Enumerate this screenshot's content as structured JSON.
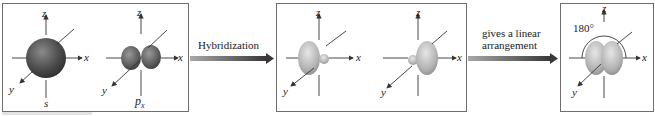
{
  "figure": {
    "panels": [
      {
        "id": "atomic-orbitals",
        "orbitals": [
          {
            "name": "s",
            "label": "s",
            "shape": "sphere"
          },
          {
            "name": "px",
            "label_main": "p",
            "label_sub": "x",
            "shape": "dumbbell"
          }
        ]
      },
      {
        "id": "hybrid-orbitals",
        "orbitals": [
          {
            "name": "sp-left",
            "shape": "large-lobe-left"
          },
          {
            "name": "sp-right",
            "shape": "large-lobe-right"
          }
        ]
      },
      {
        "id": "linear-arrangement",
        "angle_label": "180°"
      }
    ],
    "axes": {
      "x": "x",
      "y": "y",
      "z": "z"
    },
    "arrows": [
      {
        "label": "Hybridization"
      },
      {
        "label_line1": "gives a linear",
        "label_line2": "arrangement"
      }
    ],
    "colors": {
      "s_orbital": "#4a4a4a",
      "p_orbital": "#585858",
      "hybrid_orbital": "#b4b4b4",
      "arrow_dark": "#3a3a3a",
      "arrow_light": "#a0a0a0",
      "box_border": "#6e6e6e",
      "axis": "#333333"
    }
  }
}
